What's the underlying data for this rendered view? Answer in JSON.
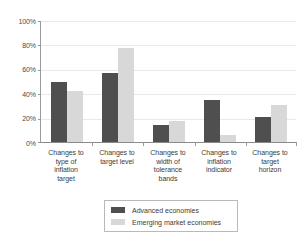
{
  "chart_data": {
    "type": "bar",
    "title": "",
    "xlabel": "",
    "ylabel": "",
    "ylim": [
      0,
      100
    ],
    "yticks": [
      "0%",
      "20%",
      "40%",
      "60%",
      "80%",
      "100%"
    ],
    "ytick_values": [
      0,
      20,
      40,
      60,
      80,
      100
    ],
    "grid": true,
    "legend_position": "bottom",
    "categories": [
      "Changes to type of inflation target",
      "Changes to target level",
      "Changes to width of tolerance bands",
      "Changes to inflation indicator",
      "Changes to target horizon"
    ],
    "category_lines": [
      [
        "Changes to",
        "type of",
        "inflation",
        "target"
      ],
      [
        "Changes to",
        "target level"
      ],
      [
        "Changes to",
        "width of",
        "tolerance",
        "bands"
      ],
      [
        "Changes to",
        "inflation",
        "indicator"
      ],
      [
        "Changes to",
        "target",
        "horizon"
      ]
    ],
    "series": [
      {
        "name": "Advanced economies",
        "color": "#4f4f4f",
        "values": [
          50,
          57,
          14,
          35,
          21
        ]
      },
      {
        "name": "Emerging market economies",
        "color": "#d8d8d8",
        "values": [
          42,
          78,
          17,
          6,
          31
        ]
      }
    ]
  }
}
